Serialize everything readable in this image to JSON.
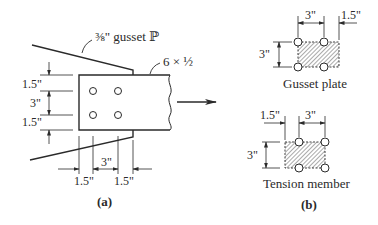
{
  "figure_a": {
    "label": "(a)",
    "gusset_callout": "⅜\" gusset ℙ",
    "member_callout": "6 × ½",
    "vertical_dims": [
      "1.5\"",
      "3\"",
      "1.5\""
    ],
    "horizontal_dims": [
      "1.5\"",
      "3\"",
      "1.5\""
    ]
  },
  "figure_b": {
    "label": "(b)",
    "gusset_plate": {
      "caption": "Gusset plate",
      "dim_top_left": "3\"",
      "dim_top_right": "1.5\"",
      "dim_vertical": "3\""
    },
    "tension_member": {
      "caption": "Tension member",
      "dim_top_left": "1.5\"",
      "dim_top_right": "3\"",
      "dim_vertical": "3\""
    }
  },
  "colors": {
    "line": "#2a2a2a",
    "hatch": "#555555",
    "background": "#ffffff"
  }
}
